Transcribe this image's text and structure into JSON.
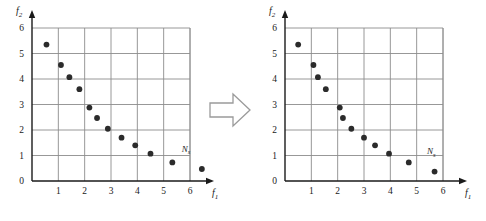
{
  "figure": {
    "name": "pareto-front-distribution-comparison",
    "background_color": "#ffffff",
    "grid_color": "#8c8c8c",
    "axis_color": "#1a1a1a",
    "point_color": "#2b2b2b",
    "arrow_outline_color": "#9a9a9a"
  },
  "arrow": {
    "name": "transformation-arrow",
    "direction": "right",
    "glyph": "⇒"
  },
  "charts": [
    {
      "id": "left",
      "axis": {
        "xlabel": "f₁",
        "ylabel": "f₂",
        "xlabel_base": "f",
        "xlabel_sub": "1",
        "ylabel_base": "f",
        "ylabel_sub": "2",
        "xticks": [
          "1",
          "2",
          "3",
          "4",
          "5",
          "6"
        ],
        "yticks": [
          "0",
          "1",
          "2",
          "3",
          "4",
          "5",
          "6"
        ]
      },
      "annotation": {
        "base": "N",
        "sub": "s",
        "text": "Nₛ"
      }
    },
    {
      "id": "right",
      "axis": {
        "xlabel": "f₁",
        "ylabel": "f₂",
        "xlabel_base": "f",
        "xlabel_sub": "1",
        "ylabel_base": "f",
        "ylabel_sub": "2",
        "xticks": [
          "1",
          "2",
          "3",
          "4",
          "5",
          "6"
        ],
        "yticks": [
          "0",
          "1",
          "2",
          "3",
          "4",
          "5",
          "6"
        ]
      },
      "annotation": {
        "base": "N",
        "sub": "s",
        "text": "Nₛ"
      }
    }
  ],
  "chart_data": [
    {
      "type": "scatter",
      "id": "left-pareto-front",
      "title": "",
      "xlabel": "f1",
      "ylabel": "f2",
      "xlim": [
        0,
        6
      ],
      "ylim": [
        0,
        6
      ],
      "xticks": [
        0,
        1,
        2,
        3,
        4,
        5,
        6
      ],
      "yticks": [
        0,
        1,
        2,
        3,
        4,
        5,
        6
      ],
      "grid": true,
      "legend": "none",
      "annotations": [
        {
          "text": "Ns",
          "x": 5.85,
          "y": 1.15
        }
      ],
      "series": [
        {
          "name": "solution set",
          "marker": "filled-circle",
          "color": "#2b2b2b",
          "points": [
            {
              "x": 0.55,
              "y": 5.35
            },
            {
              "x": 1.1,
              "y": 4.55
            },
            {
              "x": 1.42,
              "y": 4.07
            },
            {
              "x": 1.8,
              "y": 3.6
            },
            {
              "x": 2.18,
              "y": 2.88
            },
            {
              "x": 2.47,
              "y": 2.47
            },
            {
              "x": 2.88,
              "y": 2.05
            },
            {
              "x": 3.4,
              "y": 1.7
            },
            {
              "x": 3.92,
              "y": 1.4
            },
            {
              "x": 4.5,
              "y": 1.07
            },
            {
              "x": 5.33,
              "y": 0.73
            },
            {
              "x": 6.45,
              "y": 0.47
            }
          ]
        }
      ]
    },
    {
      "type": "scatter",
      "id": "right-pareto-front",
      "title": "",
      "xlabel": "f1",
      "ylabel": "f2",
      "xlim": [
        0,
        6
      ],
      "ylim": [
        0,
        6
      ],
      "xticks": [
        0,
        1,
        2,
        3,
        4,
        5,
        6
      ],
      "yticks": [
        0,
        1,
        2,
        3,
        4,
        5,
        6
      ],
      "grid": true,
      "legend": "none",
      "annotations": [
        {
          "text": "Ns",
          "x": 5.55,
          "y": 1.05
        }
      ],
      "series": [
        {
          "name": "solution set",
          "marker": "filled-circle",
          "color": "#2b2b2b",
          "points": [
            {
              "x": 0.5,
              "y": 5.35
            },
            {
              "x": 1.08,
              "y": 4.55
            },
            {
              "x": 1.25,
              "y": 4.07
            },
            {
              "x": 1.55,
              "y": 3.6
            },
            {
              "x": 2.08,
              "y": 2.88
            },
            {
              "x": 2.2,
              "y": 2.47
            },
            {
              "x": 2.52,
              "y": 2.05
            },
            {
              "x": 3.0,
              "y": 1.7
            },
            {
              "x": 3.42,
              "y": 1.4
            },
            {
              "x": 3.95,
              "y": 1.07
            },
            {
              "x": 4.7,
              "y": 0.73
            },
            {
              "x": 5.68,
              "y": 0.37
            }
          ]
        }
      ]
    }
  ]
}
